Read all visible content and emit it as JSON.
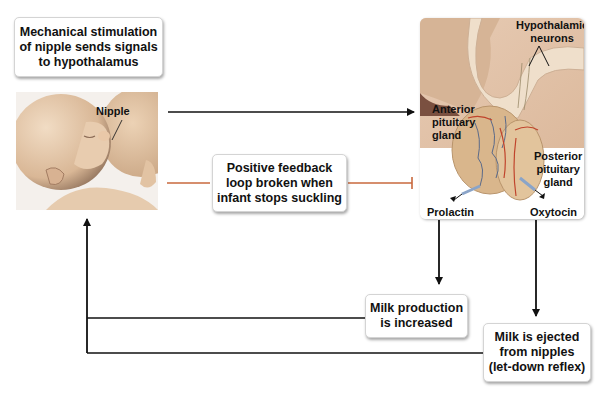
{
  "boxes": {
    "stimulation": "Mechanical stimulation of nipple sends signals to hypothalamus",
    "stimulation_lines": [
      "Mechanical stimulation",
      "of nipple sends signals",
      "to hypothalamus"
    ],
    "feedback_lines": [
      "Positive feedback",
      "loop broken when",
      "infant stops suckling"
    ],
    "milk_production_lines": [
      "Milk production",
      "is increased"
    ],
    "milk_ejected_lines": [
      "Milk is ejected",
      "from nipples",
      "(let-down reflex)"
    ]
  },
  "baby_image": {
    "label_nipple": "Nipple"
  },
  "pituitary_image": {
    "label_hypothalamic": [
      "Hypothalamic",
      "neurons"
    ],
    "label_anterior": [
      "Anterior",
      "pituitary",
      "gland"
    ],
    "label_posterior": [
      "Posterior",
      "pituitary",
      "gland"
    ],
    "label_prolactin": "Prolactin",
    "label_oxytocin": "Oxytocin"
  },
  "colors": {
    "arrow": "#111111",
    "inhibit_line": "#c8683c",
    "skin": "#e3c4a6",
    "gland": "#d9b68c"
  }
}
